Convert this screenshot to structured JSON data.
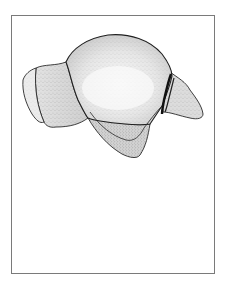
{
  "figure": {
    "subject": "bone illustration (stippled anatomical drawing)",
    "style": "pen-and-stipple line drawing",
    "frame": {
      "stroke_color": "#7a7a7a",
      "background": "#ffffff"
    },
    "colors": {
      "outline": "#2a2a2a",
      "fill_light": "#eeeeee",
      "fill_mid": "#d6d6d6",
      "fill_dark": "#b8b8b8",
      "highlight": "#f7f7f7"
    },
    "parts": [
      {
        "name": "main-body-dome"
      },
      {
        "name": "left-lobe"
      },
      {
        "name": "left-articular-facet"
      },
      {
        "name": "right-process"
      },
      {
        "name": "lower-flange"
      },
      {
        "name": "dark-groove"
      }
    ]
  }
}
